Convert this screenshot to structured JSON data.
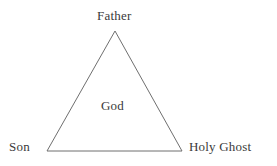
{
  "diagram": {
    "type": "triangle-diagram",
    "background_color": "#ffffff",
    "stroke_color": "#6f6f6f",
    "text_color": "#3a3a3a",
    "vertices": {
      "apex": {
        "label": "Father",
        "x": 115,
        "y": 31
      },
      "bottom_left": {
        "label": "Son",
        "x": 47,
        "y": 151
      },
      "bottom_right": {
        "label": "Holy Ghost",
        "x": 182,
        "y": 151
      }
    },
    "center": {
      "label": "God",
      "x": 117,
      "y": 106
    },
    "labels": {
      "father": "Father",
      "god": "God",
      "son": "Son",
      "holy_ghost": "Holy Ghost"
    }
  }
}
